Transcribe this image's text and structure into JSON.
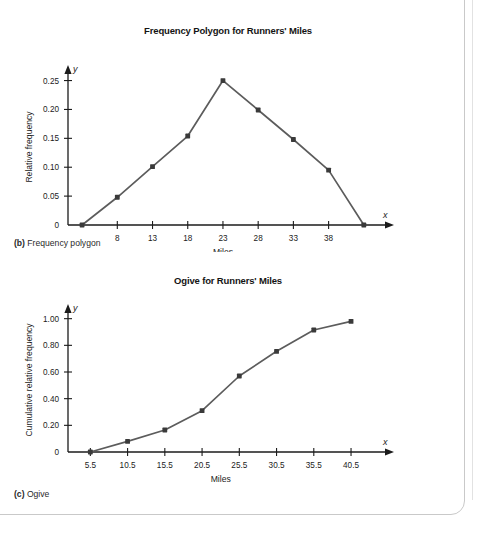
{
  "page": {
    "frame_border_color": "#c9c9c9",
    "background": "#ffffff"
  },
  "figures": [
    {
      "caption_tag": "(b)",
      "caption_text": " Frequency polygon"
    },
    {
      "caption_tag": "(c)",
      "caption_text": " Ogive"
    }
  ],
  "chart_data": [
    {
      "type": "line",
      "title": "Frequency Polygon for Runners' Miles",
      "xlabel": "Miles",
      "ylabel": "Relative frequency",
      "x_axis_letter": "x",
      "y_axis_letter": "y",
      "x": [
        3,
        8,
        13,
        18,
        23,
        28,
        33,
        38,
        43
      ],
      "values": [
        0,
        0.048,
        0.101,
        0.154,
        0.25,
        0.199,
        0.148,
        0.095,
        0
      ],
      "xticks": [
        8,
        13,
        18,
        23,
        28,
        33,
        38
      ],
      "xtick_labels": [
        "8",
        "13",
        "18",
        "23",
        "28",
        "33",
        "38"
      ],
      "yticks": [
        0,
        0.05,
        0.1,
        0.15,
        0.2,
        0.25
      ],
      "ytick_labels": [
        "0",
        "0.05",
        "0.10",
        "0.15",
        "0.20",
        "0.25"
      ],
      "xlim": [
        1,
        47
      ],
      "ylim": [
        0,
        0.27
      ],
      "grid": false,
      "legend": "none",
      "line_color": "#5c5c5c",
      "marker_color": "#3a3a3a",
      "axis_color": "#1b1b1b"
    },
    {
      "type": "line",
      "title": "Ogive for Runners' Miles",
      "xlabel": "Miles",
      "ylabel": "Cumulative relative frequency",
      "x_axis_letter": "x",
      "y_axis_letter": "y",
      "x": [
        5.5,
        10.5,
        15.5,
        20.5,
        25.5,
        30.5,
        35.5,
        40.5
      ],
      "values": [
        0,
        0.08,
        0.165,
        0.31,
        0.57,
        0.755,
        0.915,
        0.98
      ],
      "xticks": [
        5.5,
        10.5,
        15.5,
        20.5,
        25.5,
        30.5,
        35.5,
        40.5
      ],
      "xtick_labels": [
        "5.5",
        "10.5",
        "15.5",
        "20.5",
        "25.5",
        "30.5",
        "35.5",
        "40.5"
      ],
      "yticks": [
        0,
        0.2,
        0.4,
        0.6,
        0.8,
        1.0
      ],
      "ytick_labels": [
        "0",
        "0.20",
        "0.40",
        "0.60",
        "0.80",
        "1.00"
      ],
      "xlim": [
        2.5,
        46
      ],
      "ylim": [
        0,
        1.08
      ],
      "grid": false,
      "legend": "none",
      "line_color": "#5c5c5c",
      "marker_color": "#3a3a3a",
      "axis_color": "#1b1b1b"
    }
  ]
}
